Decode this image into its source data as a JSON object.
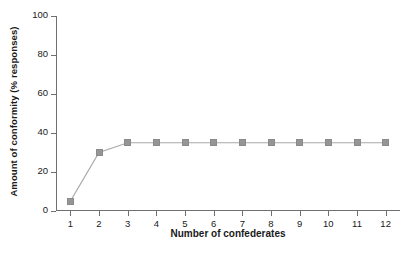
{
  "chart_data": {
    "type": "line",
    "title": "",
    "xlabel": "Number of confederates",
    "ylabel": "Amount of conformity (% responses)",
    "x": [
      1,
      2,
      3,
      4,
      5,
      6,
      7,
      8,
      9,
      10,
      11,
      12
    ],
    "values": [
      5,
      30,
      35,
      35,
      35,
      35,
      35,
      35,
      35,
      35,
      35,
      35
    ],
    "xticks": [
      "1",
      "2",
      "3",
      "4",
      "5",
      "6",
      "7",
      "8",
      "9",
      "10",
      "11",
      "12"
    ],
    "yticks": [
      "0",
      "20",
      "40",
      "60",
      "80",
      "100"
    ],
    "ytick_values": [
      0,
      20,
      40,
      60,
      80,
      100
    ],
    "xlim": [
      0.5,
      12.5
    ],
    "ylim": [
      0,
      100
    ],
    "grid": false,
    "legend": false,
    "marker": "square",
    "series_color": "#959595",
    "line_color": "#a9a9a9",
    "axis_color": "#707070",
    "text_color": "#1a1a1a",
    "background": "#ffffff"
  },
  "figure": {
    "caption_fragment": ""
  }
}
